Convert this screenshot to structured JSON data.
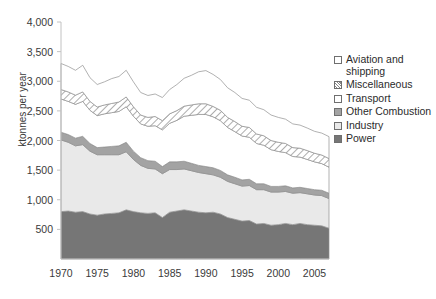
{
  "chart_data": {
    "type": "area",
    "title": "",
    "subtitle": "",
    "xlabel": "",
    "ylabel": "ktonnes per year",
    "stacked": true,
    "grid": false,
    "legend_position": "right",
    "xlim": [
      1970,
      2007
    ],
    "ylim": [
      0,
      4000
    ],
    "ytick_labels": [
      "4,000",
      "3,500",
      "3,000",
      "2,500",
      "2,000",
      "1,500",
      "1,000",
      "500"
    ],
    "ytick_values": [
      4000,
      3500,
      3000,
      2500,
      2000,
      1500,
      1000,
      500
    ],
    "xtick_labels": [
      "1970",
      "1975",
      "1980",
      "1985",
      "1990",
      "1995",
      "2000",
      "2005"
    ],
    "xtick_values": [
      1970,
      1975,
      1980,
      1985,
      1990,
      1995,
      2000,
      2005
    ],
    "x": [
      1970,
      1971,
      1972,
      1973,
      1974,
      1975,
      1976,
      1977,
      1978,
      1979,
      1980,
      1981,
      1982,
      1983,
      1984,
      1985,
      1986,
      1987,
      1988,
      1989,
      1990,
      1991,
      1992,
      1993,
      1994,
      1995,
      1996,
      1997,
      1998,
      1999,
      2000,
      2001,
      2002,
      2003,
      2004,
      2005,
      2006,
      2007
    ],
    "series": [
      {
        "name": "Power",
        "color": "#767676",
        "pattern": "solid",
        "values": [
          800,
          810,
          790,
          800,
          760,
          740,
          760,
          770,
          780,
          830,
          800,
          780,
          770,
          780,
          700,
          790,
          810,
          830,
          810,
          790,
          780,
          790,
          760,
          700,
          670,
          640,
          650,
          590,
          600,
          570,
          580,
          600,
          580,
          600,
          580,
          570,
          560,
          520
        ]
      },
      {
        "name": "Industry",
        "color": "#e9e9e9",
        "pattern": "solid",
        "values": [
          1210,
          1160,
          1120,
          1130,
          1060,
          1020,
          1000,
          990,
          980,
          980,
          880,
          800,
          760,
          740,
          740,
          720,
          700,
          690,
          680,
          670,
          660,
          630,
          620,
          610,
          600,
          590,
          590,
          580,
          570,
          560,
          550,
          540,
          530,
          520,
          520,
          510,
          510,
          500
        ]
      },
      {
        "name": "Other Combustion",
        "color": "#a3a3a3",
        "pattern": "solid",
        "values": [
          130,
          130,
          130,
          140,
          130,
          120,
          130,
          140,
          150,
          160,
          140,
          130,
          130,
          130,
          120,
          130,
          130,
          130,
          125,
          120,
          120,
          120,
          115,
          110,
          110,
          105,
          105,
          100,
          100,
          95,
          95,
          95,
          90,
          90,
          90,
          90,
          90,
          90
        ]
      },
      {
        "name": "Transport",
        "color": "#ffffff",
        "pattern": "solid",
        "values": [
          560,
          560,
          570,
          590,
          560,
          540,
          560,
          570,
          580,
          600,
          590,
          570,
          580,
          600,
          620,
          650,
          700,
          760,
          810,
          860,
          880,
          860,
          840,
          800,
          770,
          740,
          710,
          680,
          650,
          620,
          590,
          560,
          530,
          510,
          490,
          470,
          450,
          440
        ]
      },
      {
        "name": "Miscellaneous",
        "color": "#ffffff",
        "pattern": "hatch",
        "values": [
          160,
          160,
          155,
          160,
          150,
          145,
          150,
          155,
          160,
          165,
          160,
          150,
          150,
          155,
          155,
          160,
          165,
          170,
          175,
          180,
          180,
          175,
          175,
          170,
          170,
          165,
          165,
          160,
          160,
          155,
          155,
          155,
          150,
          150,
          150,
          145,
          145,
          145
        ]
      },
      {
        "name": "Aviation and shipping",
        "color": "#ffffff",
        "pattern": "solid",
        "values": [
          440,
          430,
          420,
          450,
          400,
          380,
          390,
          420,
          430,
          450,
          420,
          380,
          370,
          380,
          390,
          410,
          440,
          470,
          500,
          540,
          560,
          540,
          520,
          500,
          490,
          470,
          460,
          450,
          440,
          430,
          420,
          410,
          400,
          390,
          380,
          370,
          370,
          370
        ]
      }
    ]
  },
  "legend": {
    "entries": [
      {
        "label": "Aviation and shipping",
        "swatch": "white-swatch"
      },
      {
        "label": "Miscellaneous",
        "swatch": "hatched-swatch"
      },
      {
        "label": "Transport",
        "swatch": "white-swatch"
      },
      {
        "label": "Other Combustion",
        "swatch": "gray-swatch"
      },
      {
        "label": "Industry",
        "swatch": "light-gray-swatch"
      },
      {
        "label": "Power",
        "swatch": "dark-gray-swatch"
      }
    ]
  }
}
